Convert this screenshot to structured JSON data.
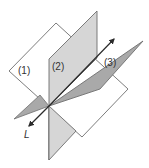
{
  "diagram": {
    "planes": [
      {
        "id": 1,
        "label": "(1)",
        "fill": "#ffffff"
      },
      {
        "id": 2,
        "label": "(2)",
        "fill": "#d6d6d6"
      },
      {
        "id": 3,
        "label": "(3)",
        "fill": "#a9a9a9"
      }
    ],
    "line": {
      "label": "L"
    },
    "colors": {
      "outline": "#6e6e6e",
      "line": "#2b2b2b"
    }
  }
}
